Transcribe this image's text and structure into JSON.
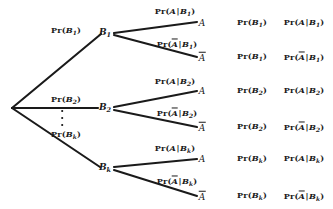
{
  "diagram": {
    "type": "probability-tree",
    "background_color": "#ffffff",
    "stroke_color": "#1a1a1a",
    "root": {
      "x": 12,
      "y": 108
    },
    "ellipsis": {
      "x": 62,
      "y": 118,
      "dots": 3
    }
  },
  "branches": [
    {
      "id": "b1",
      "node_label": "B₁",
      "node_pos": {
        "x": 105,
        "y": 33
      },
      "edge_label": "Pr(B₁)",
      "edge_label_pos": {
        "x": 66,
        "y": 31
      },
      "leaves": [
        {
          "id": "b1-a",
          "leaf_label": "A",
          "leaf_pos": {
            "x": 202,
            "y": 23
          },
          "edge_label": "Pr(A|B₁)",
          "edge_label_pos": {
            "x": 175,
            "y": 12
          },
          "col1": "Pr(B₁)",
          "col2": "Pr(A|B₁)"
        },
        {
          "id": "b1-abar",
          "leaf_label": "Ā",
          "leaf_pos": {
            "x": 202,
            "y": 57
          },
          "edge_label": "Pr(Ā|B₁)",
          "edge_label_pos": {
            "x": 177,
            "y": 44
          },
          "col1": "Pr(B₁)",
          "col2": "Pr(Ā|B₁)"
        }
      ]
    },
    {
      "id": "b2",
      "node_label": "B₂",
      "node_pos": {
        "x": 105,
        "y": 108
      },
      "edge_label": "Pr(B₂)",
      "edge_label_pos": {
        "x": 66,
        "y": 100
      },
      "leaves": [
        {
          "id": "b2-a",
          "leaf_label": "A",
          "leaf_pos": {
            "x": 202,
            "y": 91
          },
          "edge_label": "Pr(A|B₂)",
          "edge_label_pos": {
            "x": 175,
            "y": 82
          },
          "col1": "Pr(B₂)",
          "col2": "Pr(A|B₂)"
        },
        {
          "id": "b2-abar",
          "leaf_label": "Ā",
          "leaf_pos": {
            "x": 202,
            "y": 127
          },
          "edge_label": "Pr(Ā|B₂)",
          "edge_label_pos": {
            "x": 177,
            "y": 113
          },
          "col1": "Pr(B₂)",
          "col2": "Pr(Ā|B₂)"
        }
      ]
    },
    {
      "id": "bk",
      "node_label": "Bₖ",
      "node_pos": {
        "x": 105,
        "y": 168
      },
      "edge_label": "Pr(Bₖ)",
      "edge_label_pos": {
        "x": 66,
        "y": 135
      },
      "leaves": [
        {
          "id": "bk-a",
          "leaf_label": "A",
          "leaf_pos": {
            "x": 202,
            "y": 159
          },
          "edge_label": "Pr(A|Bₖ)",
          "edge_label_pos": {
            "x": 175,
            "y": 149
          },
          "col1": "Pr(Bₖ)",
          "col2": "Pr(A|Bₖ)"
        },
        {
          "id": "bk-abar",
          "leaf_label": "Ā",
          "leaf_pos": {
            "x": 202,
            "y": 196
          },
          "edge_label": "Pr(Ā|Bₖ)",
          "edge_label_pos": {
            "x": 177,
            "y": 181
          },
          "col1": "Pr(Bₖ)",
          "col2": "Pr(Ā|Bₖ)"
        }
      ]
    }
  ],
  "columns": {
    "col1_x": 252,
    "col2_x": 304
  }
}
